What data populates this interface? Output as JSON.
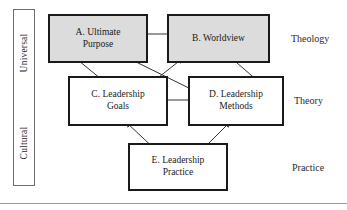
{
  "figure": {
    "background_color": "#ffffff",
    "border_color": "#1a1a1a",
    "shaded_fill": "#dcdcdc",
    "arrow_color": "#333333"
  },
  "axis_rail": {
    "labels": [
      {
        "id": "universal",
        "text": "Universal"
      },
      {
        "id": "cultural",
        "text": "Cultural"
      }
    ]
  },
  "nodes": [
    {
      "id": "a",
      "label": "A. Ultimate\nPurpose",
      "shaded": true,
      "tier": "Theology"
    },
    {
      "id": "b",
      "label": "B. Worldview",
      "shaded": true,
      "tier": "Theology"
    },
    {
      "id": "c",
      "label": "C. Leadership\nGoals",
      "shaded": false,
      "tier": "Theory"
    },
    {
      "id": "d",
      "label": "D. Leadership\nMethods",
      "shaded": false,
      "tier": "Theory"
    },
    {
      "id": "e",
      "label": "E. Leadership\nPractice",
      "shaded": false,
      "tier": "Practice"
    }
  ],
  "tiers": [
    {
      "id": "theology",
      "label": "Theology"
    },
    {
      "id": "theory",
      "label": "Theory"
    },
    {
      "id": "practice",
      "label": "Practice"
    }
  ],
  "edges": [
    {
      "id": "a-b",
      "from": "a",
      "to": "b",
      "style": "double-headed"
    },
    {
      "id": "c-d",
      "from": "c",
      "to": "d",
      "style": "double-headed"
    },
    {
      "id": "a-c",
      "from": "a",
      "to": "c",
      "style": "double-headed"
    },
    {
      "id": "b-d",
      "from": "b",
      "to": "d",
      "style": "double-headed"
    },
    {
      "id": "a-d",
      "from": "a",
      "to": "d",
      "style": "double-headed"
    },
    {
      "id": "b-c",
      "from": "b",
      "to": "c",
      "style": "double-headed"
    },
    {
      "id": "c-e",
      "from": "c",
      "to": "e",
      "style": "double-headed"
    },
    {
      "id": "d-e",
      "from": "d",
      "to": "e",
      "style": "double-headed"
    }
  ]
}
